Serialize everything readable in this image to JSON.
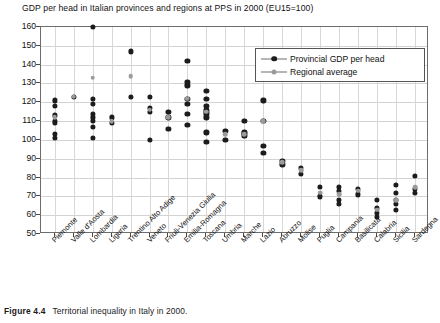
{
  "chart_data": {
    "type": "scatter",
    "title": "GDP per head in Italian provinces and regions at PPS in 2000 (EU15=100)",
    "xlabel": "",
    "ylabel": "",
    "ylim": [
      50,
      160
    ],
    "yticks": [
      50,
      60,
      70,
      80,
      90,
      100,
      110,
      120,
      130,
      140,
      150,
      160
    ],
    "grid": true,
    "legend_position": "top-right",
    "categories": [
      "Piemonte",
      "Valle d'Aosta",
      "Lombardia",
      "Liguria",
      "Trentino Alto Adige",
      "Veneto",
      "Friuli-Venezia Giulia",
      "Emilia-Romagna",
      "Toscana",
      "Umbria",
      "Marche",
      "Lazio",
      "Abruzzo",
      "Molise",
      "Puglia",
      "Campania",
      "Basilicata",
      "Calabria",
      "Sicilia",
      "Sardegna"
    ],
    "series": [
      {
        "name": "Provincial GDP per head",
        "color": "#1c1c1c",
        "marker": "circle",
        "points": [
          {
            "category": "Piemonte",
            "values": [
              121,
              118,
              113,
              110,
              109,
              103,
              101
            ]
          },
          {
            "category": "Valle d'Aosta",
            "values": [
              123
            ]
          },
          {
            "category": "Lombardia",
            "values": [
              160,
              122,
              119,
              114,
              112,
              110,
              107,
              101
            ]
          },
          {
            "category": "Liguria",
            "values": [
              112,
              109
            ]
          },
          {
            "category": "Trentino Alto Adige",
            "values": [
              147,
              123
            ]
          },
          {
            "category": "Veneto",
            "values": [
              123,
              117,
              115,
              100
            ]
          },
          {
            "category": "Friuli-Venezia Giulia",
            "values": [
              115,
              112,
              106
            ]
          },
          {
            "category": "Emilia-Romagna",
            "values": [
              142,
              131,
              129,
              122,
              119,
              114,
              108
            ]
          },
          {
            "category": "Toscana",
            "values": [
              126,
              122,
              118,
              116,
              115,
              114,
              112,
              104,
              99
            ]
          },
          {
            "category": "Umbria",
            "values": [
              105,
              100
            ]
          },
          {
            "category": "Marche",
            "values": [
              110,
              104,
              103,
              102
            ]
          },
          {
            "category": "Lazio",
            "values": [
              121,
              110,
              97,
              93
            ]
          },
          {
            "category": "Abruzzo",
            "values": [
              89,
              87
            ]
          },
          {
            "category": "Molise",
            "values": [
              85,
              82
            ]
          },
          {
            "category": "Puglia",
            "values": [
              75,
              70
            ]
          },
          {
            "category": "Campania",
            "values": [
              75,
              73,
              68,
              66
            ]
          },
          {
            "category": "Basilicata",
            "values": [
              74,
              71
            ]
          },
          {
            "category": "Calabria",
            "values": [
              68,
              64,
              61,
              59
            ]
          },
          {
            "category": "Sicilia",
            "values": [
              76,
              72,
              68,
              66,
              63
            ]
          },
          {
            "category": "Sardegna",
            "values": [
              81,
              74,
              72
            ]
          }
        ]
      },
      {
        "name": "Regional average",
        "color": "#9b9b9b",
        "marker": "circle",
        "points": [
          {
            "category": "Piemonte",
            "values": [
              112
            ]
          },
          {
            "category": "Valle d'Aosta",
            "values": [
              123
            ]
          },
          {
            "category": "Lombardia",
            "values": [
              133
            ]
          },
          {
            "category": "Liguria",
            "values": [
              110
            ]
          },
          {
            "category": "Trentino Alto Adige",
            "values": [
              134
            ]
          },
          {
            "category": "Veneto",
            "values": [
              116
            ]
          },
          {
            "category": "Friuli-Venezia Giulia",
            "values": [
              112
            ]
          },
          {
            "category": "Emilia-Romagna",
            "values": [
              122
            ]
          },
          {
            "category": "Toscana",
            "values": [
              115
            ]
          },
          {
            "category": "Umbria",
            "values": [
              103
            ]
          },
          {
            "category": "Marche",
            "values": [
              103
            ]
          },
          {
            "category": "Lazio",
            "values": [
              110
            ]
          },
          {
            "category": "Abruzzo",
            "values": [
              88
            ]
          },
          {
            "category": "Molise",
            "values": [
              84
            ]
          },
          {
            "category": "Puglia",
            "values": [
              72
            ]
          },
          {
            "category": "Campania",
            "values": [
              71
            ]
          },
          {
            "category": "Basilicata",
            "values": [
              73
            ]
          },
          {
            "category": "Calabria",
            "values": [
              63
            ]
          },
          {
            "category": "Sicilia",
            "values": [
              68
            ]
          },
          {
            "category": "Sardegna",
            "values": [
              75
            ]
          }
        ]
      }
    ]
  },
  "legend": {
    "entries": [
      {
        "label": "Provincial GDP per head"
      },
      {
        "label": "Regional average"
      }
    ]
  },
  "caption": {
    "figure_number": "Figure 4.4",
    "text": "Territorial inequality in Italy in 2000."
  }
}
